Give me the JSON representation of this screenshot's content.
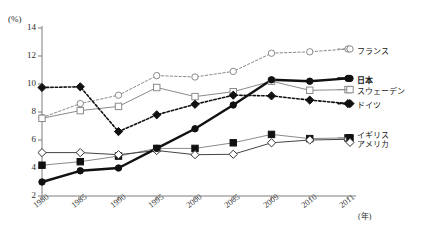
{
  "title_faint": "",
  "axis": {
    "y_unit": "(%)",
    "x_unit": "(年)",
    "y_ticks": [
      "14",
      "12",
      "10",
      "8",
      "6",
      "4",
      "2"
    ],
    "x_ticks": [
      "1980",
      "1985",
      "1990",
      "1995",
      "2000",
      "2005",
      "2009",
      "2010",
      "2011"
    ]
  },
  "legend": {
    "france": "フランス",
    "japan": "日本",
    "sweden": "スウェーデン",
    "germany": "ドイツ",
    "uk": "イギリス",
    "usa": "アメリカ"
  },
  "colors": {
    "line_dark": "#111111",
    "line_gray": "#8a8a8a",
    "text": "#2b2b2b",
    "background": "#ffffff"
  },
  "chart_data": {
    "type": "line",
    "title": "",
    "xlabel": "(年)",
    "ylabel": "(%)",
    "ylim": [
      2,
      14
    ],
    "grid": false,
    "legend_position": "right",
    "categories": [
      "1980",
      "1985",
      "1990",
      "1995",
      "2000",
      "2005",
      "2009",
      "2010",
      "2011"
    ],
    "series": [
      {
        "name": "フランス",
        "marker": "open-circle",
        "linestyle": "dotted",
        "color": "#8a8a8a",
        "values": [
          7.6,
          8.6,
          9.2,
          10.6,
          10.5,
          10.9,
          12.2,
          12.3,
          12.5
        ]
      },
      {
        "name": "日本",
        "marker": "filled-circle",
        "linestyle": "solid-thick",
        "color": "#111111",
        "values": [
          3.0,
          3.8,
          4.0,
          5.4,
          6.8,
          8.5,
          10.3,
          10.2,
          10.4
        ]
      },
      {
        "name": "スウェーデン",
        "marker": "open-square",
        "linestyle": "solid",
        "color": "#8a8a8a",
        "values": [
          7.55,
          8.1,
          8.4,
          9.75,
          9.1,
          9.45,
          10.2,
          9.55,
          9.6
        ]
      },
      {
        "name": "ドイツ",
        "marker": "filled-diamond",
        "linestyle": "dotted",
        "color": "#111111",
        "values": [
          9.75,
          9.8,
          6.6,
          7.8,
          8.55,
          9.2,
          9.15,
          8.85,
          8.6
        ]
      },
      {
        "name": "イギリス",
        "marker": "filled-square",
        "linestyle": "solid",
        "color": "#8a8a8a",
        "values": [
          4.2,
          4.45,
          4.85,
          5.4,
          5.4,
          5.8,
          6.4,
          6.1,
          6.15
        ]
      },
      {
        "name": "アメリカ",
        "marker": "open-diamond",
        "linestyle": "solid",
        "color": "#444444",
        "values": [
          5.1,
          5.1,
          4.95,
          5.25,
          4.95,
          4.98,
          5.8,
          6.0,
          6.05
        ]
      }
    ]
  }
}
